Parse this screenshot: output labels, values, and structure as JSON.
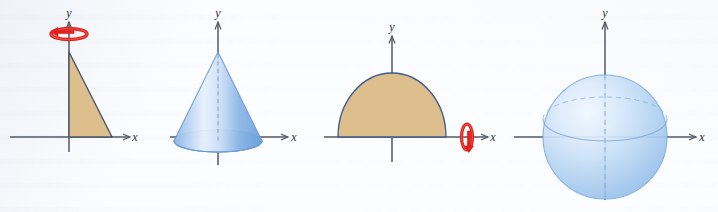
{
  "figure": {
    "background_color": "#fcfdfe",
    "panels": [
      {
        "id": "panel-1",
        "name": "triangular-region-about-y-axis",
        "caption": "Right triangular region with rotation arrow about the y-axis",
        "region_shape": "right-triangle",
        "region_fill": "#dcbf8d",
        "region_stroke": "#4a5568",
        "axis_of_revolution": "y",
        "rotation_arrow": {
          "name": "rotation-arrow-horizontal",
          "color": "#e0201b",
          "orientation": "horizontal-ellipse",
          "about_axis": "y"
        },
        "axis_labels": {
          "x": "x",
          "y": "y"
        },
        "axis_color": "#53586a"
      },
      {
        "id": "panel-2",
        "name": "cone-solid",
        "caption": "Resulting cone solid of revolution",
        "solid_shape": "cone",
        "solid_fill_light": "#dce9f9",
        "solid_fill_mid": "#9fc3ec",
        "solid_fill_dark": "#6ea3de",
        "solid_stroke": "#6d9bd2",
        "center_line_style": "dashed",
        "axis_labels": {
          "x": "x",
          "y": "y"
        },
        "axis_color": "#53586a"
      },
      {
        "id": "panel-3",
        "name": "semicircular-region-about-x-axis",
        "caption": "Semicircular region with rotation arrow about the x-axis",
        "region_shape": "semicircle",
        "region_fill": "#dcbf8d",
        "region_stroke": "#3d5a8a",
        "axis_of_revolution": "x",
        "rotation_arrow": {
          "name": "rotation-arrow-vertical",
          "color": "#e0201b",
          "orientation": "vertical-ellipse",
          "about_axis": "x"
        },
        "axis_labels": {
          "x": "x",
          "y": "y"
        },
        "axis_color": "#53586a"
      },
      {
        "id": "panel-4",
        "name": "sphere-solid",
        "caption": "Resulting sphere solid of revolution",
        "solid_shape": "sphere",
        "solid_fill_light": "#e2eefb",
        "solid_fill_mid": "#b9d5f2",
        "solid_fill_dark": "#8fbbe8",
        "solid_stroke": "#7daddb",
        "meridian_style": "dashed",
        "equator_style": "solid-and-dashed",
        "axis_labels": {
          "x": "x",
          "y": "y"
        },
        "axis_color": "#53586a"
      }
    ]
  }
}
